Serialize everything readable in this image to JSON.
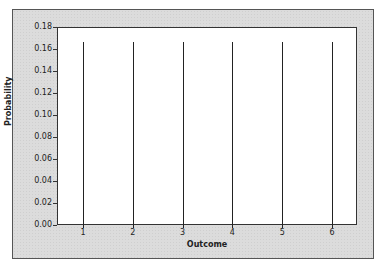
{
  "chart_data": {
    "type": "bar",
    "subtype": "stem",
    "title": "",
    "xlabel": "Outcome",
    "ylabel": "Probability",
    "categories": [
      "1",
      "2",
      "3",
      "4",
      "5",
      "6"
    ],
    "values": [
      0.1667,
      0.1667,
      0.1667,
      0.1667,
      0.1667,
      0.1667
    ],
    "ylim": [
      0,
      0.18
    ],
    "yticks": [
      "0.00",
      "0.02",
      "0.04",
      "0.06",
      "0.08",
      "0.10",
      "0.12",
      "0.14",
      "0.16",
      "0.18"
    ],
    "grid": false,
    "legend": null
  }
}
